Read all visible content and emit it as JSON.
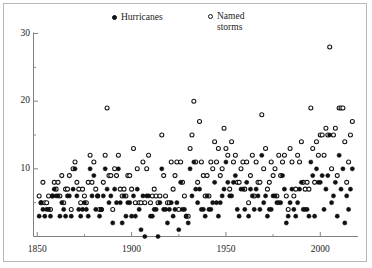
{
  "legend": {
    "position": "top",
    "entries": [
      {
        "label": "Hurricanes",
        "marker": "filled-circle-icon",
        "color": "#111111"
      },
      {
        "label": "Named",
        "label2": "storms",
        "marker": "open-circle-icon",
        "color": "#111111"
      }
    ]
  },
  "axes": {
    "x_ticks_major": [
      1850,
      1900,
      1950,
      2000
    ],
    "x_ticks_minor": [
      1875,
      1925,
      1975
    ],
    "y_ticks_major": [
      10,
      20,
      30
    ],
    "y_ticks_minor": [
      5,
      15,
      25
    ],
    "xlim": [
      1848,
      2020
    ],
    "ylim": [
      0,
      30
    ]
  },
  "chart_data": {
    "type": "scatter",
    "title": "",
    "xlabel": "",
    "ylabel": "",
    "xlim": [
      1848,
      2020
    ],
    "ylim": [
      0,
      30
    ],
    "grid": false,
    "legend_position": "top",
    "x": [
      1851,
      1852,
      1853,
      1854,
      1855,
      1856,
      1857,
      1858,
      1859,
      1860,
      1861,
      1862,
      1863,
      1864,
      1865,
      1866,
      1867,
      1868,
      1869,
      1870,
      1871,
      1872,
      1873,
      1874,
      1875,
      1876,
      1877,
      1878,
      1879,
      1880,
      1881,
      1882,
      1883,
      1884,
      1885,
      1886,
      1887,
      1888,
      1889,
      1890,
      1891,
      1892,
      1893,
      1894,
      1895,
      1896,
      1897,
      1898,
      1899,
      1900,
      1901,
      1902,
      1903,
      1904,
      1905,
      1906,
      1907,
      1908,
      1909,
      1910,
      1911,
      1912,
      1913,
      1914,
      1915,
      1916,
      1917,
      1918,
      1919,
      1920,
      1921,
      1922,
      1923,
      1924,
      1925,
      1926,
      1927,
      1928,
      1929,
      1930,
      1931,
      1932,
      1933,
      1934,
      1935,
      1936,
      1937,
      1938,
      1939,
      1940,
      1941,
      1942,
      1943,
      1944,
      1945,
      1946,
      1947,
      1948,
      1949,
      1950,
      1951,
      1952,
      1953,
      1954,
      1955,
      1956,
      1957,
      1958,
      1959,
      1960,
      1961,
      1962,
      1963,
      1964,
      1965,
      1966,
      1967,
      1968,
      1969,
      1970,
      1971,
      1972,
      1973,
      1974,
      1975,
      1976,
      1977,
      1978,
      1979,
      1980,
      1981,
      1982,
      1983,
      1984,
      1985,
      1986,
      1987,
      1988,
      1989,
      1990,
      1991,
      1992,
      1993,
      1994,
      1995,
      1996,
      1997,
      1998,
      1999,
      2000,
      2001,
      2002,
      2003,
      2004,
      2005,
      2006,
      2007,
      2008,
      2009,
      2010,
      2011,
      2012,
      2013,
      2014,
      2015,
      2016,
      2017
    ],
    "series": [
      {
        "name": "Named storms",
        "marker": "open-circle",
        "values": [
          6,
          5,
          8,
          5,
          5,
          6,
          4,
          6,
          8,
          7,
          8,
          6,
          9,
          5,
          7,
          7,
          9,
          4,
          10,
          11,
          8,
          7,
          5,
          7,
          6,
          5,
          8,
          12,
          8,
          11,
          7,
          6,
          4,
          4,
          8,
          12,
          19,
          9,
          9,
          4,
          10,
          9,
          12,
          7,
          6,
          7,
          6,
          9,
          9,
          7,
          13,
          5,
          10,
          5,
          5,
          11,
          5,
          10,
          12,
          5,
          6,
          7,
          6,
          5,
          6,
          15,
          9,
          6,
          5,
          5,
          11,
          7,
          9,
          11,
          4,
          11,
          8,
          6,
          3,
          3,
          13,
          15,
          20,
          11,
          8,
          17,
          11,
          9,
          6,
          9,
          6,
          11,
          10,
          14,
          11,
          13,
          9,
          10,
          16,
          13,
          12,
          7,
          14,
          11,
          12,
          8,
          8,
          10,
          11,
          7,
          11,
          5,
          9,
          12,
          6,
          11,
          8,
          8,
          18,
          10,
          13,
          7,
          8,
          11,
          9,
          10,
          6,
          12,
          9,
          11,
          12,
          6,
          4,
          13,
          11,
          6,
          7,
          12,
          11,
          14,
          8,
          7,
          8,
          7,
          19,
          13,
          8,
          14,
          12,
          15,
          15,
          12,
          16,
          15,
          28,
          10,
          15,
          16,
          9,
          19,
          19,
          19,
          14,
          8,
          11,
          15,
          17
        ]
      },
      {
        "name": "Hurricanes",
        "marker": "filled-circle",
        "values": [
          3,
          5,
          4,
          3,
          4,
          4,
          3,
          6,
          7,
          6,
          6,
          3,
          5,
          4,
          3,
          6,
          6,
          3,
          7,
          10,
          6,
          4,
          3,
          4,
          5,
          4,
          3,
          10,
          6,
          9,
          4,
          6,
          3,
          4,
          6,
          10,
          7,
          5,
          6,
          2,
          7,
          5,
          10,
          5,
          2,
          6,
          3,
          5,
          5,
          3,
          6,
          3,
          7,
          4,
          1,
          6,
          0,
          6,
          6,
          3,
          3,
          4,
          4,
          0,
          5,
          10,
          4,
          4,
          2,
          4,
          5,
          3,
          4,
          5,
          1,
          8,
          4,
          4,
          3,
          2,
          10,
          6,
          11,
          7,
          5,
          7,
          4,
          4,
          3,
          6,
          4,
          4,
          5,
          8,
          5,
          3,
          5,
          6,
          7,
          11,
          8,
          6,
          6,
          8,
          9,
          4,
          3,
          7,
          7,
          4,
          8,
          3,
          7,
          6,
          4,
          7,
          6,
          4,
          12,
          5,
          6,
          3,
          4,
          4,
          6,
          6,
          5,
          5,
          5,
          9,
          7,
          2,
          3,
          5,
          7,
          4,
          3,
          5,
          7,
          8,
          4,
          4,
          4,
          3,
          11,
          9,
          3,
          10,
          8,
          8,
          9,
          4,
          7,
          9,
          15,
          5,
          6,
          8,
          3,
          12,
          7,
          10,
          2,
          6,
          4,
          7,
          10
        ]
      }
    ]
  }
}
